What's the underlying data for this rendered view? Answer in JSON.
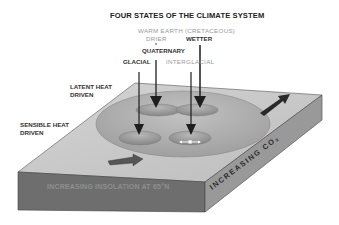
{
  "title": "FOUR STATES OF THE CLIMATE SYSTEM",
  "state_labels": {
    "warm_earth": "WARM EARTH (CRETACEOUS)",
    "drier": "DRIER",
    "wetter": "WETTER",
    "quaternary": "QUATERNARY",
    "glacial": "GLACIAL",
    "interglacial": "INTERGLACIAL"
  },
  "side_labels": {
    "latent_line1": "LATENT HEAT",
    "latent_line2": "DRIVEN",
    "sensible_line1": "SENSIBLE HEAT",
    "sensible_line2": "DRIVEN"
  },
  "axis_labels": {
    "front_face": "INCREASING INSOLATION AT 65°N",
    "right_face": "INCREASING CO₂"
  },
  "colors": {
    "slab_top": "#c9c9c9",
    "slab_front": "#6e6e6e",
    "slab_side": "#9a9a9a",
    "ellipse": "#a8a8a8",
    "arrow": "#1e1e1e"
  }
}
